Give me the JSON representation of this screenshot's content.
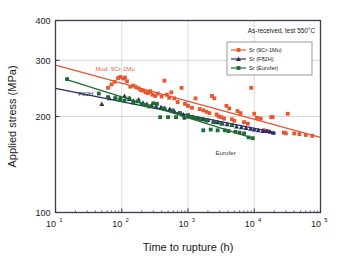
{
  "chart_data": {
    "type": "scatter",
    "title": "",
    "xlabel": "Time to rupture (h)",
    "ylabel": "Applied stress (MPa)",
    "xscale": "log",
    "yscale": "log",
    "xlim": [
      10,
      100000
    ],
    "ylim": [
      100,
      400
    ],
    "xticks": [
      "10^1",
      "10^2",
      "10^3",
      "10^4",
      "10^5"
    ],
    "xtick_labels": [
      "1",
      "2",
      "3",
      "4",
      "5"
    ],
    "xtick_base": "10",
    "yticks": [
      100,
      200,
      300,
      400
    ],
    "grid": "horizontal-at-200-300, vertical-at-decades",
    "annotation_condition": "As-received, test 550°C",
    "annotations": [
      {
        "text": "Mod. 9Cr-1Mo",
        "color": "#e8633a",
        "x": 40,
        "y": 278
      },
      {
        "text": "F82H",
        "color": "#2b2b66",
        "x": 22,
        "y": 232
      },
      {
        "text": "Eurofer",
        "color": "#3a3a3a",
        "x": 2600,
        "y": 152
      }
    ],
    "legend_position": "top-right",
    "legend_title": "",
    "series": [
      {
        "name": "Sr (9Cr-1Mo)",
        "color": "#e8552e",
        "marker": "square",
        "line": {
          "x": [
            10,
            100000
          ],
          "y": [
            290,
            172
          ]
        },
        "points": [
          [
            62,
            246
          ],
          [
            70,
            252
          ],
          [
            78,
            257
          ],
          [
            88,
            264
          ],
          [
            95,
            266
          ],
          [
            105,
            263
          ],
          [
            112,
            265
          ],
          [
            120,
            258
          ],
          [
            135,
            248
          ],
          [
            150,
            250
          ],
          [
            165,
            247
          ],
          [
            180,
            245
          ],
          [
            195,
            242
          ],
          [
            210,
            241
          ],
          [
            230,
            238
          ],
          [
            250,
            237
          ],
          [
            270,
            240
          ],
          [
            290,
            234
          ],
          [
            320,
            232
          ],
          [
            350,
            236
          ],
          [
            400,
            231
          ],
          [
            440,
            259
          ],
          [
            480,
            234
          ],
          [
            520,
            229
          ],
          [
            560,
            238
          ],
          [
            620,
            228
          ],
          [
            700,
            222
          ],
          [
            800,
            246
          ],
          [
            900,
            219
          ],
          [
            1000,
            216
          ],
          [
            1150,
            213
          ],
          [
            1300,
            228
          ],
          [
            1500,
            211
          ],
          [
            1700,
            209
          ],
          [
            1900,
            207
          ],
          [
            2100,
            205
          ],
          [
            2300,
            232
          ],
          [
            2500,
            228
          ],
          [
            2700,
            203
          ],
          [
            2900,
            200
          ],
          [
            3200,
            199
          ],
          [
            3500,
            197
          ],
          [
            3800,
            216
          ],
          [
            4200,
            212
          ],
          [
            4600,
            196
          ],
          [
            5000,
            194
          ],
          [
            5600,
            208
          ],
          [
            6200,
            205
          ],
          [
            7000,
            192
          ],
          [
            8000,
            190
          ],
          [
            9000,
            246
          ],
          [
            10000,
            204
          ],
          [
            11000,
            198
          ],
          [
            12500,
            197
          ],
          [
            14000,
            181
          ],
          [
            16000,
            180
          ],
          [
            18000,
            199
          ],
          [
            19000,
            199
          ],
          [
            28000,
            178
          ],
          [
            30000,
            177
          ],
          [
            32000,
            204
          ],
          [
            40000,
            177
          ],
          [
            48000,
            176
          ],
          [
            60000,
            175
          ],
          [
            75000,
            174
          ]
        ]
      },
      {
        "name": "Sr (F82H)",
        "color": "#2b2b66",
        "marker": "triangle",
        "line": {
          "x": [
            10,
            21000
          ],
          "y": [
            245,
            178
          ]
        },
        "points": [
          [
            50,
            219
          ],
          [
            65,
            228
          ],
          [
            80,
            230
          ],
          [
            95,
            229
          ],
          [
            110,
            232
          ],
          [
            130,
            227
          ],
          [
            150,
            224
          ],
          [
            180,
            226
          ],
          [
            210,
            221
          ],
          [
            240,
            219
          ],
          [
            280,
            217
          ],
          [
            330,
            215
          ],
          [
            390,
            214
          ],
          [
            450,
            212
          ],
          [
            530,
            211
          ],
          [
            620,
            208
          ],
          [
            720,
            205
          ],
          [
            850,
            203
          ],
          [
            1000,
            200
          ],
          [
            1200,
            199
          ],
          [
            1400,
            198
          ],
          [
            1700,
            196
          ],
          [
            2000,
            195
          ],
          [
            2400,
            193
          ],
          [
            2800,
            192
          ],
          [
            3300,
            190
          ],
          [
            3900,
            189
          ],
          [
            4600,
            188
          ],
          [
            5400,
            186
          ],
          [
            6400,
            185
          ],
          [
            7500,
            184
          ],
          [
            8800,
            183
          ],
          [
            10000,
            182
          ],
          [
            11500,
            181
          ],
          [
            13500,
            180
          ],
          [
            15500,
            180
          ],
          [
            17500,
            179
          ],
          [
            19500,
            178
          ]
        ]
      },
      {
        "name": "Sr (Eurofer)",
        "color": "#1e6b33",
        "marker": "square",
        "line": {
          "x": [
            14,
            9500
          ],
          "y": [
            262,
            171
          ]
        },
        "points": [
          [
            15,
            262
          ],
          [
            45,
            236
          ],
          [
            62,
            230
          ],
          [
            80,
            228
          ],
          [
            95,
            226
          ],
          [
            110,
            224
          ],
          [
            130,
            228
          ],
          [
            150,
            221
          ],
          [
            175,
            223
          ],
          [
            200,
            219
          ],
          [
            230,
            217
          ],
          [
            260,
            215
          ],
          [
            300,
            220
          ],
          [
            340,
            219
          ],
          [
            380,
            199
          ],
          [
            430,
            212
          ],
          [
            500,
            199
          ],
          [
            580,
            209
          ],
          [
            660,
            199
          ],
          [
            760,
            205
          ],
          [
            880,
            198
          ],
          [
            1000,
            202
          ],
          [
            1150,
            199
          ],
          [
            1350,
            198
          ],
          [
            1550,
            196
          ],
          [
            1700,
            181
          ],
          [
            1900,
            194
          ],
          [
            2200,
            182
          ],
          [
            2500,
            192
          ],
          [
            2800,
            181
          ],
          [
            3200,
            190
          ],
          [
            3600,
            181
          ],
          [
            4100,
            180
          ],
          [
            4600,
            188
          ],
          [
            5200,
            179
          ],
          [
            6000,
            178
          ],
          [
            7000,
            177
          ],
          [
            8200,
            172
          ],
          [
            9500,
            171
          ]
        ]
      }
    ]
  },
  "legend": {
    "entries": [
      {
        "label": "Sr (9Cr-1Mo)"
      },
      {
        "label": "Sr (F82H)"
      },
      {
        "label": "Sr (Eurofer)"
      }
    ]
  },
  "axes": {
    "x_title": "Time to rupture (h)",
    "y_title": "Applied stress (MPa)",
    "y_tick_labels": [
      "400",
      "300",
      "200",
      "100"
    ],
    "x_tick_mantissa": "10",
    "x_tick_exponents": [
      "1",
      "2",
      "3",
      "4",
      "5"
    ]
  },
  "colors": {
    "series_9cr1mo": "#e8552e",
    "series_f82h": "#2b2b66",
    "series_eurofer": "#1e6b33",
    "frame": "#3b3b4f",
    "grid": "#c9c9c9",
    "background": "#ffffff"
  }
}
